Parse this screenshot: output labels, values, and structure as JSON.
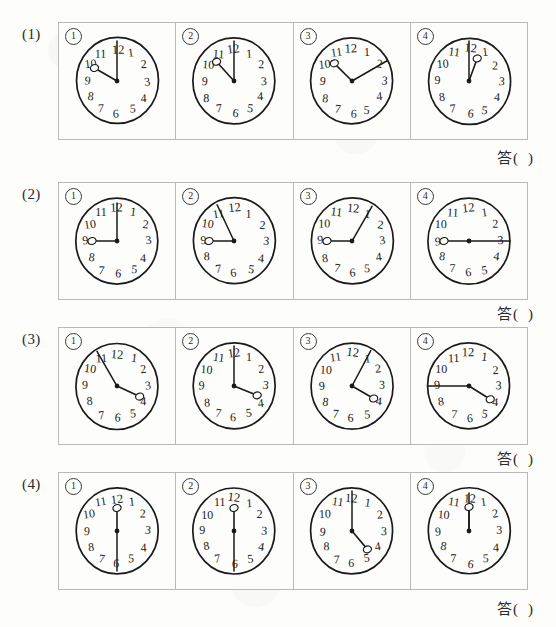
{
  "page": {
    "kind": "worksheet",
    "title_visible": false,
    "ink_color": "#1a1a1a",
    "rule_color": "#b9b9b6",
    "paper_color": "#fdfdfc",
    "answer_label": "答（　　）",
    "answer_label_parts": {
      "word": "答",
      "open": "(",
      "close": ")"
    }
  },
  "clock_face": {
    "hour_numbers": [
      "12",
      "1",
      "2",
      "3",
      "4",
      "5",
      "6",
      "7",
      "8",
      "9",
      "10",
      "11"
    ],
    "center_dot": true,
    "hand_end_marker": "small-open-circle"
  },
  "rows": [
    {
      "label": "(1)",
      "answer": "答（　　）",
      "clocks": [
        {
          "marker": "①",
          "minute_deg": 0,
          "hour_deg": 300,
          "minute_len": 40,
          "hour_len": 26,
          "hour_marker": true,
          "minute_marker": false
        },
        {
          "marker": "②",
          "minute_deg": 0,
          "hour_deg": 318,
          "minute_len": 40,
          "hour_len": 26,
          "hour_marker": true,
          "minute_marker": false
        },
        {
          "marker": "③",
          "minute_deg": 60,
          "hour_deg": 315,
          "minute_len": 40,
          "hour_len": 25,
          "hour_marker": true,
          "minute_marker": false
        },
        {
          "marker": "④",
          "minute_deg": 0,
          "hour_deg": 20,
          "minute_len": 40,
          "hour_len": 24,
          "hour_marker": true,
          "minute_marker": false
        }
      ]
    },
    {
      "label": "(2)",
      "answer": "答（　　）",
      "clocks": [
        {
          "marker": "①",
          "minute_deg": 0,
          "hour_deg": 270,
          "minute_len": 38,
          "hour_len": 25,
          "hour_marker": true,
          "minute_marker": false
        },
        {
          "marker": "②",
          "minute_deg": 335,
          "hour_deg": 270,
          "minute_len": 40,
          "hour_len": 25,
          "hour_marker": true,
          "minute_marker": false
        },
        {
          "marker": "③",
          "minute_deg": 30,
          "hour_deg": 270,
          "minute_len": 40,
          "hour_len": 25,
          "hour_marker": true,
          "minute_marker": false
        },
        {
          "marker": "④",
          "minute_deg": 90,
          "hour_deg": 270,
          "minute_len": 41,
          "hour_len": 25,
          "hour_marker": true,
          "minute_marker": false
        }
      ]
    },
    {
      "label": "(3)",
      "answer": "答（　　）",
      "clocks": [
        {
          "marker": "①",
          "minute_deg": 330,
          "hour_deg": 115,
          "minute_len": 40,
          "hour_len": 25,
          "hour_marker": true,
          "minute_marker": false
        },
        {
          "marker": "②",
          "minute_deg": 0,
          "hour_deg": 112,
          "minute_len": 40,
          "hour_len": 25,
          "hour_marker": true,
          "minute_marker": false
        },
        {
          "marker": "③",
          "minute_deg": 28,
          "hour_deg": 120,
          "minute_len": 40,
          "hour_len": 25,
          "hour_marker": true,
          "minute_marker": false
        },
        {
          "marker": "④",
          "minute_deg": 270,
          "hour_deg": 122,
          "minute_len": 41,
          "hour_len": 25,
          "hour_marker": true,
          "minute_marker": false
        }
      ]
    },
    {
      "label": "(4)",
      "answer": "答（　　）",
      "clocks": [
        {
          "marker": "①",
          "minute_deg": 180,
          "hour_deg": 0,
          "minute_len": 40,
          "hour_len": 23,
          "hour_marker": true,
          "minute_marker": false
        },
        {
          "marker": "②",
          "minute_deg": 180,
          "hour_deg": 0,
          "minute_len": 40,
          "hour_len": 23,
          "hour_marker": true,
          "minute_marker": false
        },
        {
          "marker": "③",
          "minute_deg": 0,
          "hour_deg": 140,
          "minute_len": 40,
          "hour_len": 24,
          "hour_marker": true,
          "minute_marker": false
        },
        {
          "marker": "④",
          "minute_deg": 0,
          "hour_deg": 0,
          "minute_len": 38,
          "hour_len": 24,
          "hour_marker": true,
          "minute_marker": false
        }
      ]
    }
  ],
  "row_tops": [
    22,
    182,
    327,
    472
  ],
  "answer_tops": [
    146,
    302,
    447,
    597
  ]
}
